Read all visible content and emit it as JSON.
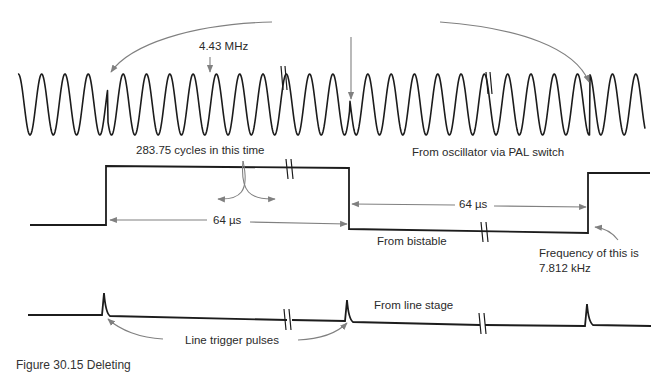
{
  "figure": {
    "caption": "Figure 30.15 Deleting",
    "labels": {
      "subcarrier_freq": "4.43 MHz",
      "oscillator": "From oscillator via PAL switch",
      "cycles": "283.75 cycles in this time",
      "period_1": "64 µs",
      "period_2": "64 µs",
      "bistable": "From bistable",
      "freq_line1": "Frequency of this is",
      "freq_line2": "7.812 kHz",
      "line_stage": "From line stage",
      "trigger": "Line trigger pulses"
    },
    "colors": {
      "trace": "#1c1c1c",
      "annotation": "#808080",
      "text": "#2a2a2a",
      "background": "#ffffff"
    },
    "waveforms": [
      {
        "name": "subcarrier",
        "type": "sine",
        "frequency": "4.43 MHz",
        "source": "From oscillator via PAL switch"
      },
      {
        "name": "bistable",
        "type": "square",
        "half_period": "64 µs",
        "frequency": "7.812 kHz",
        "source": "From bistable"
      },
      {
        "name": "line_pulses",
        "type": "pulse",
        "source": "From line stage"
      }
    ]
  }
}
